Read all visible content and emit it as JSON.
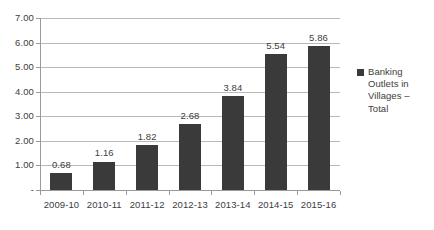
{
  "chart_data": {
    "type": "bar",
    "title": "",
    "subtitle": "",
    "xlabel": "",
    "ylabel": "",
    "categories": [
      "2009-10",
      "2010-11",
      "2011-12",
      "2012-13",
      "2013-14",
      "2014-15",
      "2015-16"
    ],
    "values": [
      0.68,
      1.16,
      1.82,
      2.68,
      3.84,
      5.54,
      5.86
    ],
    "data_labels": [
      "0.68",
      "1.16",
      "1.82",
      "2.68",
      "3.84",
      "5.54",
      "5.86"
    ],
    "series": [
      {
        "name": "Banking Outlets in Villages – Total",
        "values": [
          0.68,
          1.16,
          1.82,
          2.68,
          3.84,
          5.54,
          5.86
        ],
        "color": "#3a3a3a"
      }
    ],
    "ylim": [
      0,
      7
    ],
    "ytick_values": [
      7,
      6,
      5,
      4,
      3,
      2,
      1,
      0
    ],
    "ytick_labels": [
      "7.00",
      "6.00",
      "5.00",
      "4.00",
      "3.00",
      "2.00",
      "1.00",
      "-"
    ],
    "grid": true,
    "grid_color": "#b9b9b9",
    "axis_color": "#9a9a9a",
    "legend_position": "right",
    "legend_entries": [
      "Banking Outlets in Villages – Total"
    ],
    "background_color": "#ffffff",
    "text_color": "#3d3d3d"
  },
  "legend": {
    "marker_name": "legend-color-swatch",
    "label": "Banking Outlets in Villages – Total"
  }
}
